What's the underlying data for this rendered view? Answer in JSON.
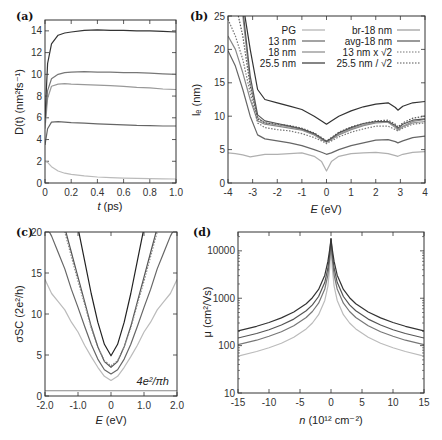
{
  "chart_data": [
    {
      "panel": "(a)",
      "type": "line",
      "title": "",
      "xlabel": "t (ps)",
      "ylabel": "D(t) (nm²fs⁻¹)",
      "xlim": [
        0,
        1.0
      ],
      "ylim": [
        0,
        15
      ],
      "xticks": [
        "0",
        "0.2",
        "0.4",
        "0.6",
        "0.8",
        "1.0"
      ],
      "yticks": [
        "0",
        "2",
        "4",
        "6",
        "8",
        "10",
        "12",
        "14"
      ],
      "x": [
        0,
        0.02,
        0.05,
        0.1,
        0.15,
        0.2,
        0.3,
        0.4,
        0.5,
        0.6,
        0.7,
        0.8,
        0.9,
        1.0
      ],
      "series": [
        {
          "name": "PG",
          "color": "#bbbbbb",
          "values": [
            2.0,
            1.9,
            1.5,
            1.1,
            0.9,
            0.8,
            0.65,
            0.55,
            0.5,
            0.45,
            0.42,
            0.4,
            0.38,
            0.37
          ]
        },
        {
          "name": "13 nm",
          "color": "#666666",
          "values": [
            3.5,
            5.0,
            5.6,
            5.65,
            5.6,
            5.55,
            5.5,
            5.45,
            5.4,
            5.35,
            5.3,
            5.28,
            5.25,
            5.25
          ]
        },
        {
          "name": "18 nm",
          "color": "#999999",
          "values": [
            5.0,
            7.8,
            8.9,
            9.1,
            9.15,
            9.1,
            9.05,
            9.0,
            8.95,
            8.9,
            8.8,
            8.75,
            8.65,
            8.6
          ]
        },
        {
          "name": "br-18 nm",
          "color": "#777777",
          "values": [
            5.5,
            8.5,
            9.6,
            10.0,
            10.15,
            10.2,
            10.25,
            10.2,
            10.2,
            10.15,
            10.15,
            10.1,
            10.05,
            10.0
          ]
        },
        {
          "name": "25.5 nm",
          "color": "#333333",
          "values": [
            6.0,
            11.0,
            12.8,
            13.6,
            13.8,
            13.9,
            14.05,
            14.1,
            14.05,
            14.05,
            14.0,
            14.0,
            13.95,
            13.9
          ]
        }
      ]
    },
    {
      "panel": "(b)",
      "type": "line",
      "xlabel": "E (eV)",
      "ylabel": "l_e (nm)",
      "xlim": [
        -4,
        4
      ],
      "ylim": [
        0,
        25
      ],
      "xticks": [
        "-4",
        "-3",
        "-2",
        "-1",
        "0",
        "1",
        "2",
        "3",
        "4"
      ],
      "yticks": [
        "0",
        "5",
        "10",
        "15",
        "20",
        "25"
      ],
      "legend": {
        "position": "top",
        "left": [
          "PG",
          "13 nm",
          "18 nm",
          "25.5 nm"
        ],
        "right": [
          "br-18 nm",
          "avg-18 nm",
          "13 nm x √2",
          "25.5 nm / √2"
        ]
      },
      "x": [
        -4,
        -3.7,
        -3.4,
        -3.1,
        -2.8,
        -2.5,
        -2,
        -1.5,
        -1,
        -0.5,
        -0.2,
        0,
        0.2,
        0.5,
        1,
        1.5,
        2,
        2.5,
        2.8,
        2.9,
        3.1,
        3.5,
        4
      ],
      "series": [
        {
          "name": "PG",
          "color": "#b0b0b0",
          "dash": false,
          "values": [
            4.5,
            4.4,
            4.2,
            3.9,
            4.1,
            4.3,
            4.3,
            4.4,
            4.5,
            4.0,
            3.2,
            1.8,
            3.2,
            4.0,
            4.4,
            4.5,
            4.6,
            4.4,
            4.1,
            4.0,
            4.3,
            4.6,
            4.7
          ]
        },
        {
          "name": "13 nm",
          "color": "#666666",
          "dash": false,
          "values": [
            19.8,
            17.5,
            14.0,
            10.0,
            7.2,
            6.6,
            6.3,
            6.0,
            5.6,
            5.0,
            4.6,
            4.3,
            4.5,
            5.0,
            5.6,
            6.0,
            6.4,
            6.5,
            6.2,
            6.0,
            6.3,
            6.8,
            7.0
          ]
        },
        {
          "name": "18 nm",
          "color": "#888888",
          "dash": false,
          "values": [
            22.0,
            20.0,
            16.5,
            12.5,
            9.3,
            8.8,
            8.5,
            8.2,
            7.9,
            7.2,
            6.5,
            6.1,
            6.5,
            7.2,
            8.0,
            8.6,
            9.0,
            9.1,
            8.4,
            8.0,
            8.5,
            9.2,
            9.5
          ]
        },
        {
          "name": "25.5 nm",
          "color": "#333333",
          "dash": false,
          "values": [
            27,
            27,
            27,
            20.0,
            14.0,
            12.5,
            12.0,
            11.5,
            11.0,
            10.0,
            9.3,
            8.8,
            9.3,
            10.0,
            10.8,
            11.4,
            11.8,
            12.0,
            11.3,
            10.9,
            11.5,
            12.0,
            12.2
          ]
        },
        {
          "name": "br-18 nm",
          "color": "#999999",
          "dash": false,
          "values": [
            27,
            27,
            25.0,
            15.0,
            9.8,
            9.0,
            8.7,
            8.4,
            8.0,
            7.3,
            6.6,
            6.2,
            6.6,
            7.3,
            8.1,
            8.7,
            9.1,
            9.1,
            8.3,
            7.9,
            8.4,
            9.0,
            9.2
          ]
        },
        {
          "name": "avg-18 nm",
          "color": "#555555",
          "dash": false,
          "values": [
            27,
            27,
            26.0,
            16.0,
            10.2,
            9.3,
            8.9,
            8.5,
            8.1,
            7.4,
            6.7,
            6.2,
            6.7,
            7.5,
            8.3,
            8.9,
            9.2,
            9.2,
            8.6,
            8.2,
            8.8,
            9.4,
            9.6
          ]
        },
        {
          "name": "13 nm x √2",
          "color": "#777777",
          "dash": true,
          "values": [
            24.5,
            22.0,
            18.5,
            13.5,
            9.0,
            8.3,
            8.0,
            7.8,
            7.4,
            6.8,
            6.3,
            5.9,
            6.3,
            6.9,
            7.6,
            8.1,
            8.5,
            8.5,
            8.0,
            7.8,
            8.2,
            8.8,
            9.0
          ]
        },
        {
          "name": "25.5 nm / √2",
          "color": "#555555",
          "dash": true,
          "values": [
            27,
            27,
            22.0,
            14.5,
            9.6,
            9.0,
            8.8,
            8.6,
            8.2,
            7.5,
            6.8,
            6.3,
            6.8,
            7.6,
            8.4,
            8.9,
            9.3,
            9.4,
            8.8,
            8.4,
            9.0,
            9.7,
            10.0
          ]
        }
      ]
    },
    {
      "panel": "(c)",
      "type": "line",
      "xlabel": "E (eV)",
      "ylabel": "σ_SC (2e²/h)",
      "xlim": [
        -2.0,
        2.0
      ],
      "ylim": [
        0,
        20
      ],
      "xticks": [
        "-2.0",
        "-1.0",
        "0",
        "1.0",
        "2.0"
      ],
      "yticks": [
        "0",
        "5",
        "10",
        "15",
        "20"
      ],
      "annotation": {
        "text": "4e²/πh",
        "value": 0.64
      },
      "x": [
        -2.0,
        -1.8,
        -1.6,
        -1.4,
        -1.2,
        -1.0,
        -0.8,
        -0.6,
        -0.4,
        -0.2,
        0,
        0.2,
        0.4,
        0.6,
        0.8,
        1.0,
        1.2,
        1.4,
        1.6,
        1.8,
        2.0
      ],
      "series": [
        {
          "name": "PG",
          "color": "#bbbbbb",
          "dash": false,
          "values": [
            14.2,
            12.5,
            11.5,
            10.5,
            9.0,
            7.8,
            6.2,
            4.8,
            3.5,
            2.4,
            1.9,
            2.4,
            3.5,
            4.8,
            6.2,
            7.8,
            9.0,
            10.5,
            11.5,
            12.5,
            14.2
          ]
        },
        {
          "name": "13 nm",
          "color": "#666666",
          "dash": false,
          "values": [
            21,
            19.5,
            17.5,
            15.5,
            13.0,
            10.8,
            8.5,
            6.3,
            4.5,
            3.2,
            2.7,
            3.2,
            4.5,
            6.3,
            8.5,
            10.8,
            13.0,
            15.5,
            17.5,
            19.5,
            21
          ]
        },
        {
          "name": "18 nm",
          "color": "#555555",
          "dash": false,
          "values": [
            22,
            22,
            22,
            20.5,
            17.5,
            14.5,
            11.5,
            8.5,
            6.0,
            4.2,
            3.5,
            4.2,
            6.0,
            8.5,
            11.5,
            14.5,
            17.5,
            20.5,
            22,
            22,
            22
          ]
        },
        {
          "name": "13 nm x √2",
          "color": "#888888",
          "dash": true,
          "values": [
            22,
            22,
            22,
            20.0,
            17.0,
            14.0,
            11.2,
            8.3,
            6.0,
            4.3,
            3.7,
            4.3,
            6.0,
            8.3,
            11.2,
            14.0,
            17.0,
            20.0,
            22,
            22,
            22
          ]
        },
        {
          "name": "25.5 nm",
          "color": "#222222",
          "dash": false,
          "values": [
            22,
            22,
            22,
            22,
            22,
            20.5,
            16.5,
            12.5,
            9.0,
            6.3,
            4.9,
            6.3,
            9.0,
            12.5,
            16.5,
            20.5,
            22,
            22,
            22,
            22,
            22
          ]
        }
      ]
    },
    {
      "panel": "(d)",
      "type": "line",
      "xlabel": "n (10¹² cm⁻²)",
      "ylabel": "μ (cm²/Vs)",
      "xlim": [
        -15,
        15
      ],
      "ylim": [
        10,
        25000
      ],
      "yscale": "log",
      "xticks": [
        "-15",
        "-10",
        "-5",
        "0",
        "5",
        "10",
        "15"
      ],
      "yticks": [
        "10",
        "100",
        "1000",
        "10000"
      ],
      "x": [
        -15,
        -12,
        -10,
        -8,
        -6,
        -4,
        -3,
        -2,
        -1,
        -0.5,
        -0.2,
        0,
        0.2,
        0.5,
        1,
        2,
        3,
        4,
        6,
        8,
        10,
        12,
        15
      ],
      "series": [
        {
          "name": "PG",
          "color": "#bbbbbb",
          "values": [
            60,
            75,
            90,
            112,
            150,
            225,
            300,
            450,
            900,
            1800,
            4500,
            18000,
            4500,
            1800,
            900,
            450,
            300,
            225,
            150,
            112,
            90,
            75,
            60
          ]
        },
        {
          "name": "13 nm",
          "color": "#777777",
          "values": [
            105,
            130,
            157,
            196,
            262,
            393,
            524,
            786,
            1570,
            3100,
            7000,
            18000,
            7000,
            3100,
            1570,
            786,
            524,
            393,
            262,
            196,
            157,
            130,
            105
          ]
        },
        {
          "name": "18 nm",
          "color": "#555555",
          "values": [
            145,
            180,
            217,
            272,
            362,
            543,
            724,
            1086,
            2170,
            4300,
            9000,
            18000,
            9000,
            4300,
            2170,
            1086,
            724,
            543,
            362,
            272,
            217,
            180,
            145
          ]
        },
        {
          "name": "25.5 nm",
          "color": "#333333",
          "values": [
            205,
            256,
            307,
            384,
            512,
            768,
            1024,
            1536,
            3070,
            6000,
            11000,
            18000,
            11000,
            6000,
            3070,
            1536,
            1024,
            768,
            512,
            384,
            307,
            256,
            205
          ]
        }
      ]
    }
  ],
  "labels": {
    "a": "(a)",
    "b": "(b)",
    "c": "(c)",
    "d": "(d)",
    "a_xlabel_var": "t",
    "a_xlabel_unit": " (ps)",
    "b_xlabel_var": "E",
    "b_xlabel_unit": " (eV)",
    "c_xlabel_var": "E",
    "c_xlabel_unit": " (eV)",
    "d_xlabel_var": "n",
    "d_xlabel_unit": " (10¹² cm⁻²)",
    "a_ylabel": "D(t) (nm²fs⁻¹)",
    "b_ylabel": "lₑ (nm)",
    "c_ylabel": "σSC (2e²/h)",
    "d_ylabel": "μ (cm²/Vs)",
    "c_annotation": "4e²/πh"
  }
}
